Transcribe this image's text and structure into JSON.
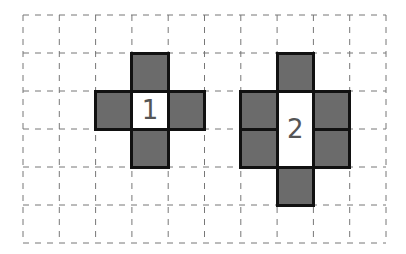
{
  "grid": {
    "cols": 10,
    "rows": 6,
    "origin_x": 23,
    "origin_y": 15,
    "cell_w": 36.3,
    "cell_h": 38,
    "line_color": "#777777",
    "line_style": "dashed"
  },
  "figures": [
    {
      "label": "1",
      "center": {
        "col": 3,
        "row": 2,
        "w": 1,
        "h": 1
      },
      "gray_cells": [
        {
          "col": 3,
          "row": 1
        },
        {
          "col": 2,
          "row": 2
        },
        {
          "col": 4,
          "row": 2
        },
        {
          "col": 3,
          "row": 3
        }
      ]
    },
    {
      "label": "2",
      "center": {
        "col": 7,
        "row": 2,
        "w": 1,
        "h": 2
      },
      "gray_cells": [
        {
          "col": 7,
          "row": 1
        },
        {
          "col": 6,
          "row": 2
        },
        {
          "col": 8,
          "row": 2
        },
        {
          "col": 6,
          "row": 3
        },
        {
          "col": 8,
          "row": 3
        },
        {
          "col": 7,
          "row": 4
        }
      ]
    }
  ],
  "colors": {
    "gray_fill": "#6b6b6b",
    "outline": "#111111",
    "label": "#555555"
  }
}
